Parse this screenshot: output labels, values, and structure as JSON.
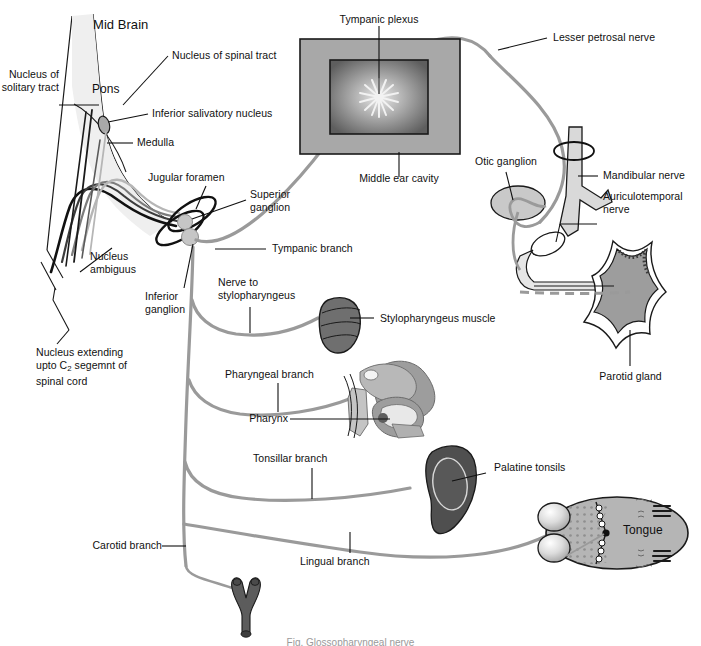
{
  "figure": {
    "caption": "Fig. Glossopharyngeal nerve"
  },
  "colors": {
    "nerve_gray": "#9a9a9a",
    "nerve_dark": "#111111",
    "nerve_mid": "#5a5a5a",
    "nerve_light": "#c8c8c8",
    "brainstem_fill": "#efefef",
    "organ_dark": "#4f4f4f",
    "organ_mid": "#9d9d9d",
    "organ_light": "#d2d2d2",
    "box_gray": "#a8a8a8",
    "text": "#101010",
    "outline": "#1a1a1a"
  },
  "labels": {
    "mid_brain": "Mid Brain",
    "pons": "Pons",
    "medulla": "Medulla",
    "nucleus_solitary_tract": "Nucleus of\nsolitary tract",
    "nucleus_spinal_tract": "Nucleus of spinal tract",
    "inferior_salivatory_nucleus": "Inferior salivatory nucleus",
    "nucleus_ambiguus": "Nucleus\nambiguus",
    "nucleus_extending_l1": "Nucleus extending",
    "nucleus_extending_l2_pre": "upto C",
    "nucleus_extending_l2_sub": "2",
    "nucleus_extending_l2_post": " segemnt of",
    "nucleus_extending_l3": "spinal cord",
    "jugular_foramen": "Jugular foramen",
    "superior_ganglion": "Superior\nganglion",
    "inferior_ganglion": "Inferior\nganglion",
    "tympanic_branch": "Tympanic branch",
    "tympanic_plexus": "Tympanic plexus",
    "middle_ear_cavity": "Middle ear cavity",
    "lesser_petrosal_nerve": "Lesser petrosal nerve",
    "otic_ganglion": "Otic ganglion",
    "mandibular_nerve": "Mandibular nerve",
    "auriculotemporal_nerve": "Auriculotemporal\nnerve",
    "parotid_gland": "Parotid gland",
    "nerve_to_stylopharyngeus": "Nerve to\nstylopharyngeus",
    "stylopharyngeus_muscle": "Stylopharyngeus muscle",
    "pharyngeal_branch": "Pharyngeal branch",
    "pharynx": "Pharynx",
    "tonsillar_branch": "Tonsillar branch",
    "palatine_tonsils": "Palatine tonsils",
    "lingual_branch": "Lingual branch",
    "carotid_branch": "Carotid branch",
    "tongue": "Tongue"
  }
}
